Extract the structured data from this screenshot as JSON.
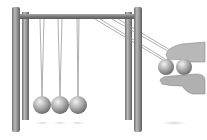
{
  "illustration": {
    "subject": "Newton's cradle with a hand holding two balls pulled back",
    "hanging_balls_count": 3,
    "held_balls_count": 2,
    "colors": {
      "background": "#ffffff",
      "post": "#8a8a8a",
      "post_highlight": "#c4c4c4",
      "bar": "#7f7f7f",
      "string": "#9a9a9a",
      "ball_light": "#e6e6e6",
      "ball_dark": "#7a7a7a",
      "hand": "#b3b3b3",
      "shadow": "#d6d6d6"
    }
  }
}
